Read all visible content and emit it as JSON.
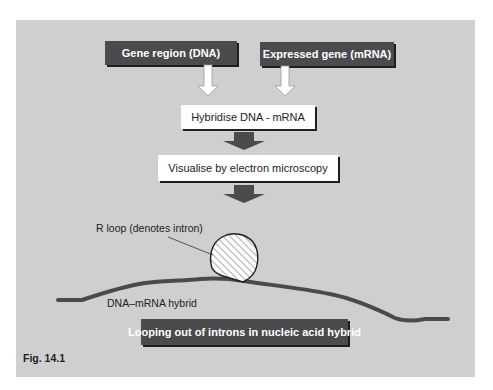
{
  "figure": {
    "caption": "Fig. 14.1",
    "background_color": "#cfcfcf",
    "dark_box_color": "#4b4b4d",
    "curve_color": "#4a4a4c"
  },
  "inputs": {
    "dna_box": "Gene region (DNA)",
    "mrna_box": "Expressed gene (mRNA)"
  },
  "steps": [
    {
      "label": "Hybridise DNA - mRNA"
    },
    {
      "label": "Visualise by electron microscopy"
    }
  ],
  "illustration": {
    "r_loop_label": "R loop (denotes intron)",
    "hybrid_label": "DNA–mRNA hybrid"
  },
  "result": {
    "label": "Looping out of introns in nucleic acid hybrid"
  }
}
